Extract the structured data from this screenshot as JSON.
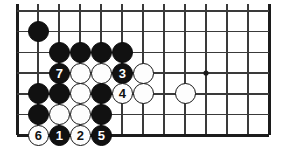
{
  "diagram": {
    "type": "go-board-problem",
    "board_region": {
      "columns": 13,
      "rows": 7,
      "left_edge_visible": true,
      "bottom_edge_visible": true,
      "top_edge_visible": false,
      "right_edge_visible": true
    },
    "colors": {
      "background": "#ffffff",
      "grid_line": "#3a3a3a",
      "edge_line": "#1c1c1c",
      "black_stone": "#111111",
      "white_stone": "#fdfdfd",
      "stone_outline": "#141414",
      "black_label_text": "#ffffff",
      "white_label_text": "#111111"
    },
    "geometry": {
      "origin_x": 17,
      "origin_y": 11,
      "spacing_x": 21,
      "spacing_y": 20.7,
      "stone_diameter": 21
    },
    "star_points": [
      {
        "name": "hoshi",
        "col": 9,
        "row": 3
      }
    ],
    "stones": [
      {
        "name": "black-stone",
        "color": "black",
        "col": 1,
        "row": 1,
        "label": ""
      },
      {
        "name": "black-stone",
        "color": "black",
        "col": 2,
        "row": 2,
        "label": ""
      },
      {
        "name": "black-stone",
        "color": "black",
        "col": 3,
        "row": 2,
        "label": ""
      },
      {
        "name": "black-stone",
        "color": "black",
        "col": 4,
        "row": 2,
        "label": ""
      },
      {
        "name": "black-stone",
        "color": "black",
        "col": 5,
        "row": 2,
        "label": ""
      },
      {
        "name": "black-move-7",
        "color": "black",
        "col": 2,
        "row": 3,
        "label": "7"
      },
      {
        "name": "white-stone",
        "color": "white",
        "col": 3,
        "row": 3,
        "label": ""
      },
      {
        "name": "white-stone",
        "color": "white",
        "col": 4,
        "row": 3,
        "label": ""
      },
      {
        "name": "black-move-3",
        "color": "black",
        "col": 5,
        "row": 3,
        "label": "3"
      },
      {
        "name": "white-stone",
        "color": "white",
        "col": 6,
        "row": 3,
        "label": ""
      },
      {
        "name": "black-stone",
        "color": "black",
        "col": 1,
        "row": 4,
        "label": ""
      },
      {
        "name": "black-stone",
        "color": "black",
        "col": 2,
        "row": 4,
        "label": ""
      },
      {
        "name": "white-stone",
        "color": "white",
        "col": 3,
        "row": 4,
        "label": ""
      },
      {
        "name": "black-stone",
        "color": "black",
        "col": 4,
        "row": 4,
        "label": ""
      },
      {
        "name": "white-move-4",
        "color": "white",
        "col": 5,
        "row": 4,
        "label": "4"
      },
      {
        "name": "white-stone",
        "color": "white",
        "col": 6,
        "row": 4,
        "label": ""
      },
      {
        "name": "white-stone",
        "color": "white",
        "col": 8,
        "row": 4,
        "label": ""
      },
      {
        "name": "black-stone",
        "color": "black",
        "col": 1,
        "row": 5,
        "label": ""
      },
      {
        "name": "white-stone",
        "color": "white",
        "col": 2,
        "row": 5,
        "label": ""
      },
      {
        "name": "white-stone",
        "color": "white",
        "col": 3,
        "row": 5,
        "label": ""
      },
      {
        "name": "black-stone",
        "color": "black",
        "col": 4,
        "row": 5,
        "label": ""
      },
      {
        "name": "white-move-6",
        "color": "white",
        "col": 1,
        "row": 6,
        "label": "6"
      },
      {
        "name": "black-move-1",
        "color": "black",
        "col": 2,
        "row": 6,
        "label": "1"
      },
      {
        "name": "white-move-2",
        "color": "white",
        "col": 3,
        "row": 6,
        "label": "2"
      },
      {
        "name": "black-move-5",
        "color": "black",
        "col": 4,
        "row": 6,
        "label": "5"
      }
    ],
    "move_sequence": [
      {
        "number": "1",
        "color": "black"
      },
      {
        "number": "2",
        "color": "white"
      },
      {
        "number": "3",
        "color": "black"
      },
      {
        "number": "4",
        "color": "white"
      },
      {
        "number": "5",
        "color": "black"
      },
      {
        "number": "6",
        "color": "white"
      },
      {
        "number": "7",
        "color": "black"
      }
    ]
  }
}
